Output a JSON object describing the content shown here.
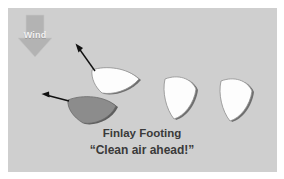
{
  "canvas": {
    "width": 284,
    "height": 179,
    "background_color": "#ffffff",
    "panel_color": "#cfcfcf"
  },
  "wind": {
    "label": "Wind",
    "direction": "down",
    "arrow_color": "#b3b3b3",
    "label_color": "#f2f2f2"
  },
  "caption": {
    "name": "Finlay Footing",
    "quote": "“Clean air ahead!”",
    "color": "#3a3a3a"
  },
  "boats": [
    {
      "id": "boat-upper-left",
      "fill": "#fdfdfd",
      "shadow": "#6f6f6f",
      "has_course_arrow": true,
      "arrow_color": "#111111",
      "heading": "up-left"
    },
    {
      "id": "boat-lower-left",
      "fill": "#8c8c8c",
      "shadow": "#5e5e5e",
      "has_course_arrow": true,
      "arrow_color": "#111111",
      "heading": "up-left"
    },
    {
      "id": "boat-middle-right",
      "fill": "#fdfdfd",
      "shadow": "#6f6f6f",
      "has_course_arrow": false,
      "arrow_color": "",
      "heading": "up"
    },
    {
      "id": "boat-far-right",
      "fill": "#fdfdfd",
      "shadow": "#6f6f6f",
      "has_course_arrow": false,
      "arrow_color": "",
      "heading": "up"
    }
  ]
}
